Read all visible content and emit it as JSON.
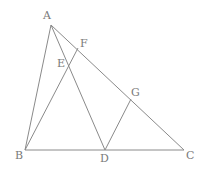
{
  "diagram": {
    "type": "geometry",
    "points": {
      "A": {
        "x": 51,
        "y": 25,
        "label": "A",
        "lx": 43,
        "ly": 19
      },
      "B": {
        "x": 25,
        "y": 150,
        "label": "B",
        "lx": 15,
        "ly": 159
      },
      "C": {
        "x": 184,
        "y": 150,
        "label": "C",
        "lx": 186,
        "ly": 159
      },
      "D": {
        "x": 105,
        "y": 150,
        "label": "D",
        "lx": 100,
        "ly": 162
      },
      "E": {
        "x": 69,
        "y": 62,
        "label": "E",
        "lx": 57,
        "ly": 67
      },
      "F": {
        "x": 78,
        "y": 48,
        "label": "F",
        "lx": 80,
        "ly": 47
      },
      "G": {
        "x": 131,
        "y": 99,
        "label": "G",
        "lx": 131,
        "ly": 96
      }
    },
    "segments": [
      {
        "from": "A",
        "to": "B"
      },
      {
        "from": "A",
        "to": "C"
      },
      {
        "from": "B",
        "to": "C"
      },
      {
        "from": "A",
        "to": "D"
      },
      {
        "from": "B",
        "to": "F"
      },
      {
        "from": "D",
        "to": "G"
      }
    ]
  }
}
